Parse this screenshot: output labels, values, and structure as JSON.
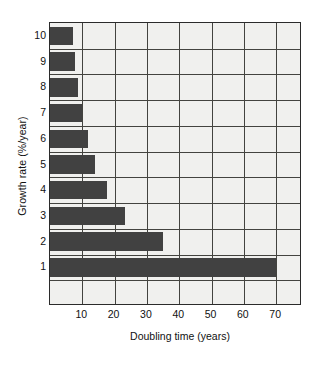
{
  "chart_data": {
    "type": "bar",
    "orientation": "horizontal",
    "title": "",
    "xlabel": "Doubling time (years)",
    "ylabel": "Growth rate (%/year)",
    "categories": [
      "1",
      "2",
      "3",
      "4",
      "5",
      "6",
      "7",
      "8",
      "9",
      "10"
    ],
    "values": [
      70,
      35,
      23.3,
      17.5,
      14,
      11.7,
      10,
      8.75,
      7.8,
      7
    ],
    "xlim": [
      0,
      78
    ],
    "xticks": [
      10,
      20,
      30,
      40,
      50,
      60,
      70
    ],
    "xticklabels": [
      "10",
      "20",
      "30",
      "40",
      "50",
      "60",
      "70"
    ],
    "grid": true,
    "legend": null,
    "bar_color": "#414141",
    "plot_background": "#f0f0ee",
    "grid_color": "#43433f",
    "axis_color": "#2b2b2b"
  }
}
